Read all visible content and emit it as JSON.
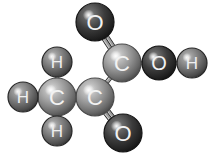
{
  "canvas": {
    "width": 212,
    "height": 156,
    "background": "#ffffff",
    "title": "Pyruvic acid ball-and-stick model"
  },
  "style": {
    "bond_color": "#3a3a3a",
    "bond_highlight": "#8d8d8d",
    "bond_width": 3.2,
    "bond_double_gap": 3.6,
    "outline_color": "#1b1b1b",
    "outline_width": 1.2,
    "carbon_color": "#8e8e8e",
    "carbon_edge_color": "#4a4a4a",
    "carbon_highlight": "#d9d9d9",
    "oxygen_color": "#3c3c3c",
    "oxygen_edge_color": "#141414",
    "oxygen_highlight": "#dcdcdc",
    "hydrogen_color": "#6f6f6f",
    "hydrogen_edge_color": "#262626",
    "hydrogen_highlight": "#cfcfcf",
    "carbon_label_color": "#f2f2f2",
    "oxygen_label_color": "#f2f2f2",
    "hydrogen_label_color": "#efefef"
  },
  "molecule": {
    "name": "pyruvic acid",
    "formula": "CH3COCOOH",
    "atoms": [
      {
        "id": "O1",
        "element": "O",
        "label": "O",
        "x": 95,
        "y": 22,
        "r": 19,
        "kind": "oxygen"
      },
      {
        "id": "C1",
        "element": "C",
        "label": "C",
        "x": 122,
        "y": 63,
        "r": 19,
        "kind": "carbon"
      },
      {
        "id": "O2",
        "element": "O",
        "label": "O",
        "x": 159,
        "y": 63,
        "r": 17,
        "kind": "oxygen"
      },
      {
        "id": "H1",
        "element": "H",
        "label": "H",
        "x": 192,
        "y": 63,
        "r": 15,
        "kind": "hydrogen"
      },
      {
        "id": "C2",
        "element": "C",
        "label": "C",
        "x": 95,
        "y": 97,
        "r": 19,
        "kind": "carbon"
      },
      {
        "id": "O3",
        "element": "O",
        "label": "O",
        "x": 123,
        "y": 133,
        "r": 19,
        "kind": "oxygen"
      },
      {
        "id": "C3",
        "element": "C",
        "label": "C",
        "x": 57,
        "y": 97,
        "r": 19,
        "kind": "carbon"
      },
      {
        "id": "H2",
        "element": "H",
        "label": "H",
        "x": 23,
        "y": 97,
        "r": 15,
        "kind": "hydrogen"
      },
      {
        "id": "H3",
        "element": "H",
        "label": "H",
        "x": 57,
        "y": 62,
        "r": 15,
        "kind": "hydrogen"
      },
      {
        "id": "H4",
        "element": "H",
        "label": "H",
        "x": 57,
        "y": 131,
        "r": 15,
        "kind": "hydrogen"
      }
    ],
    "bonds": [
      {
        "id": "b1",
        "from": "O1",
        "to": "C1",
        "order": 2,
        "name": "bond-o1-c1-double"
      },
      {
        "id": "b2",
        "from": "C1",
        "to": "O2",
        "order": 1,
        "name": "bond-c1-o2-single"
      },
      {
        "id": "b3",
        "from": "O2",
        "to": "H1",
        "order": 1,
        "name": "bond-o2-h1-single"
      },
      {
        "id": "b4",
        "from": "C1",
        "to": "C2",
        "order": 1,
        "name": "bond-c1-c2-single"
      },
      {
        "id": "b5",
        "from": "C2",
        "to": "O3",
        "order": 2,
        "name": "bond-c2-o3-double"
      },
      {
        "id": "b6",
        "from": "C2",
        "to": "C3",
        "order": 1,
        "name": "bond-c2-c3-single"
      },
      {
        "id": "b7",
        "from": "C3",
        "to": "H2",
        "order": 1,
        "name": "bond-c3-h2-single"
      },
      {
        "id": "b8",
        "from": "C3",
        "to": "H3",
        "order": 1,
        "name": "bond-c3-h3-single"
      },
      {
        "id": "b9",
        "from": "C3",
        "to": "H4",
        "order": 1,
        "name": "bond-c3-h4-single"
      }
    ]
  }
}
